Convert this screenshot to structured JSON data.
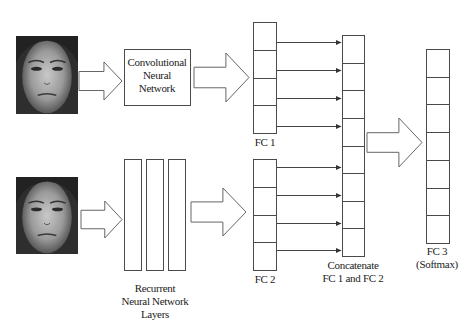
{
  "diagram": {
    "colors": {
      "stroke": "#4a4a4a",
      "arrow_stroke": "#666666",
      "background": "#ffffff",
      "text": "#222222"
    },
    "inputs": [
      {
        "id": "face-top",
        "label": "Face image (input to CNN)",
        "x": 16,
        "y": 36,
        "w": 62,
        "h": 78
      },
      {
        "id": "face-bottom",
        "label": "Face image (input to RNN)",
        "x": 16,
        "y": 177,
        "w": 62,
        "h": 77
      }
    ],
    "cnn_box": {
      "lines": [
        "Convolutional",
        "Neural",
        "Network"
      ],
      "x": 124,
      "y": 49,
      "w": 66,
      "h": 56
    },
    "rnn_layers": {
      "lines": [
        "Recurrent",
        "Neural Network",
        "Layers"
      ],
      "bars": [
        124,
        146,
        168
      ],
      "y": 159,
      "w": 17,
      "h": 111
    },
    "fc1": {
      "label": "FC 1",
      "x": 253,
      "y": 22,
      "w": 23,
      "h": 111,
      "cells": 4
    },
    "fc2": {
      "label": "FC 2",
      "x": 253,
      "y": 159,
      "w": 23,
      "h": 111,
      "cells": 4
    },
    "concat": {
      "lines": [
        "Concatenate",
        "FC 1 and FC 2"
      ],
      "x": 342,
      "y": 35,
      "w": 22,
      "h": 221,
      "cells": 8
    },
    "fc3": {
      "lines": [
        "FC 3",
        "(Softmax)"
      ],
      "x": 426,
      "y": 49,
      "w": 23,
      "h": 194,
      "cells": 7
    },
    "block_arrows": [
      {
        "id": "face-to-cnn",
        "x": 79,
        "y": 62,
        "w": 43,
        "h": 38,
        "shaft": 0.5
      },
      {
        "id": "cnn-to-fc1",
        "x": 194,
        "y": 53,
        "w": 55,
        "h": 49,
        "shaft": 0.42
      },
      {
        "id": "face-to-rnn",
        "x": 81,
        "y": 201,
        "w": 41,
        "h": 37,
        "shaft": 0.5
      },
      {
        "id": "rnn-to-fc2",
        "x": 191,
        "y": 188,
        "w": 55,
        "h": 48,
        "shaft": 0.42
      },
      {
        "id": "concat-to-fc3",
        "x": 367,
        "y": 118,
        "w": 55,
        "h": 49,
        "shaft": 0.4
      }
    ],
    "connectors": {
      "from_x": 276,
      "to_x": 341,
      "fc1_ys": [
        42,
        70,
        98,
        126
      ],
      "fc2_ys": [
        167,
        195,
        223,
        250
      ]
    }
  }
}
